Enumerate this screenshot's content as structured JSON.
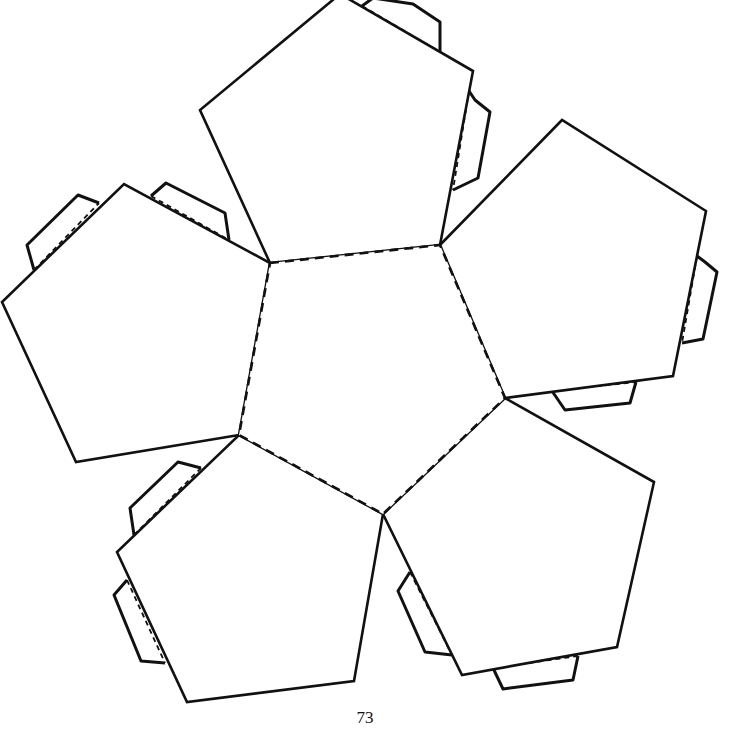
{
  "diagram": {
    "page_number": "73",
    "stroke_color": "#111111",
    "background": "#ffffff",
    "center_face": {
      "name": "center",
      "points": [
        [
          270,
          263
        ],
        [
          440,
          245
        ],
        [
          505,
          398
        ],
        [
          383,
          514
        ],
        [
          239,
          435
        ]
      ],
      "style": "dashed-fold"
    },
    "outer_faces": [
      {
        "name": "top",
        "points": [
          [
            270,
            263
          ],
          [
            200,
            110
          ],
          [
            340,
            -6
          ],
          [
            473,
            71
          ],
          [
            440,
            245
          ]
        ]
      },
      {
        "name": "right",
        "points": [
          [
            440,
            245
          ],
          [
            562,
            120
          ],
          [
            706,
            211
          ],
          [
            673,
            376
          ],
          [
            505,
            398
          ]
        ]
      },
      {
        "name": "bottom-right",
        "points": [
          [
            505,
            398
          ],
          [
            654,
            482
          ],
          [
            617,
            647
          ],
          [
            462,
            675
          ],
          [
            383,
            514
          ]
        ]
      },
      {
        "name": "bottom-left",
        "points": [
          [
            383,
            514
          ],
          [
            354,
            681
          ],
          [
            187,
            702
          ],
          [
            117,
            552
          ],
          [
            239,
            435
          ]
        ]
      },
      {
        "name": "left",
        "points": [
          [
            239,
            435
          ],
          [
            76,
            462
          ],
          [
            2,
            302
          ],
          [
            124,
            184
          ],
          [
            270,
            263
          ]
        ]
      }
    ],
    "glue_tabs": [
      {
        "name": "tab-top-upper",
        "points": [
          [
            362,
            6
          ],
          [
            373,
            -2
          ],
          [
            413,
            4
          ],
          [
            440,
            22
          ],
          [
            440,
            52
          ]
        ],
        "fold": [
          [
            362,
            6
          ],
          [
            440,
            52
          ]
        ]
      },
      {
        "name": "tab-top-right",
        "points": [
          [
            469,
            91
          ],
          [
            475,
            100
          ],
          [
            490,
            112
          ],
          [
            478,
            178
          ],
          [
            453,
            190
          ]
        ],
        "fold": [
          [
            469,
            91
          ],
          [
            453,
            190
          ]
        ]
      },
      {
        "name": "tab-right-side",
        "points": [
          [
            697,
            256
          ],
          [
            705,
            262
          ],
          [
            717,
            272
          ],
          [
            703,
            339
          ],
          [
            682,
            343
          ]
        ],
        "fold": [
          [
            697,
            256
          ],
          [
            682,
            343
          ]
        ]
      },
      {
        "name": "tab-right-bottom",
        "points": [
          [
            552,
            391
          ],
          [
            565,
            410
          ],
          [
            630,
            403
          ],
          [
            636,
            382
          ],
          [
            636,
            382
          ]
        ],
        "fold": [
          [
            552,
            391
          ],
          [
            636,
            382
          ]
        ]
      },
      {
        "name": "tab-br-bottom",
        "points": [
          [
            493,
            668
          ],
          [
            503,
            689
          ],
          [
            573,
            680
          ],
          [
            578,
            656
          ],
          [
            578,
            656
          ]
        ],
        "fold": [
          [
            493,
            668
          ],
          [
            578,
            656
          ]
        ]
      },
      {
        "name": "tab-br-left",
        "points": [
          [
            410,
            572
          ],
          [
            398,
            591
          ],
          [
            425,
            652
          ],
          [
            452,
            655
          ],
          [
            452,
            655
          ]
        ],
        "fold": [
          [
            410,
            572
          ],
          [
            452,
            655
          ]
        ]
      },
      {
        "name": "tab-bl-upper",
        "points": [
          [
            134,
            535
          ],
          [
            130,
            508
          ],
          [
            178,
            462
          ],
          [
            201,
            468
          ],
          [
            201,
            468
          ]
        ],
        "fold": [
          [
            134,
            535
          ],
          [
            201,
            468
          ]
        ]
      },
      {
        "name": "tab-bl-left",
        "points": [
          [
            127,
            580
          ],
          [
            114,
            595
          ],
          [
            141,
            661
          ],
          [
            165,
            663
          ],
          [
            165,
            663
          ]
        ],
        "fold": [
          [
            127,
            580
          ],
          [
            165,
            663
          ]
        ]
      },
      {
        "name": "tab-left-upper",
        "points": [
          [
            34,
            270
          ],
          [
            27,
            245
          ],
          [
            78,
            195
          ],
          [
            99,
            203
          ],
          [
            99,
            203
          ]
        ],
        "fold": [
          [
            34,
            270
          ],
          [
            99,
            203
          ]
        ]
      },
      {
        "name": "tab-left-top",
        "points": [
          [
            151,
            196
          ],
          [
            166,
            183
          ],
          [
            225,
            213
          ],
          [
            229,
            240
          ],
          [
            229,
            240
          ]
        ],
        "fold": [
          [
            151,
            196
          ],
          [
            229,
            240
          ]
        ]
      }
    ]
  }
}
